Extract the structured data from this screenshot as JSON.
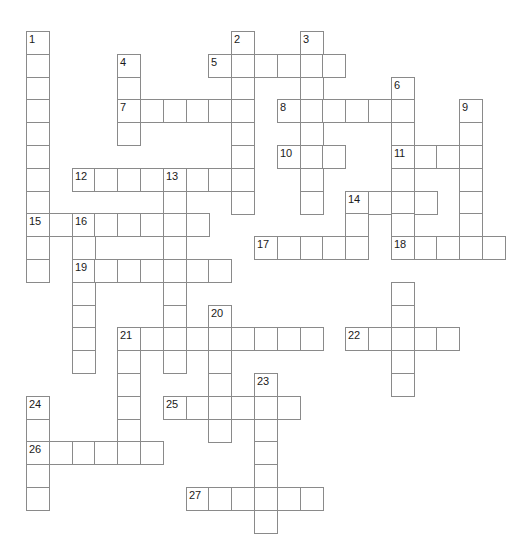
{
  "puzzle": {
    "kind": "crossword-grid",
    "title": "Crossword puzzle grid",
    "cell_size": 22.8,
    "origin_x": 26,
    "origin_y": 31,
    "cols": 21,
    "rows": 22,
    "colors": {
      "background": "#ffffff",
      "cell_fill": "#ffffff",
      "cell_border": "#8a8a8a",
      "number_text": "#1a1a1a"
    },
    "entries": [
      {
        "number": 1,
        "direction": "down",
        "row": 0,
        "col": 0,
        "length": 10
      },
      {
        "number": 2,
        "direction": "down",
        "row": 0,
        "col": 9,
        "length": 8
      },
      {
        "number": 3,
        "direction": "down",
        "row": 0,
        "col": 12,
        "length": 7
      },
      {
        "number": 4,
        "direction": "down",
        "row": 1,
        "col": 4,
        "length": 4
      },
      {
        "number": 5,
        "direction": "across",
        "row": 1,
        "col": 8,
        "length": 6
      },
      {
        "number": 6,
        "direction": "down",
        "row": 2,
        "col": 16,
        "length": 3
      },
      {
        "number": 7,
        "direction": "across",
        "row": 3,
        "col": 4,
        "length": 5
      },
      {
        "number": 8,
        "direction": "across",
        "row": 3,
        "col": 11,
        "length": 5
      },
      {
        "number": 9,
        "direction": "down",
        "row": 3,
        "col": 19,
        "length": 7
      },
      {
        "number": 10,
        "direction": "across",
        "row": 5,
        "col": 11,
        "length": 3
      },
      {
        "number": 11,
        "direction": "across",
        "row": 5,
        "col": 16,
        "length": 3
      },
      {
        "number": 12,
        "direction": "across",
        "row": 6,
        "col": 2,
        "length": 8
      },
      {
        "number": 13,
        "direction": "down",
        "row": 6,
        "col": 6,
        "length": 5
      },
      {
        "number": 14,
        "direction": "across",
        "row": 7,
        "col": 14,
        "length": 4
      },
      {
        "number": 15,
        "direction": "across",
        "row": 8,
        "col": 0,
        "length": 2
      },
      {
        "number": 16,
        "direction": "across",
        "row": 8,
        "col": 2,
        "length": 6
      },
      {
        "number": 17,
        "direction": "across",
        "row": 9,
        "col": 10,
        "length": 5
      },
      {
        "number": 18,
        "direction": "across",
        "row": 9,
        "col": 16,
        "length": 5
      },
      {
        "number": 19,
        "direction": "across",
        "row": 10,
        "col": 2,
        "length": 7
      },
      {
        "number": 20,
        "direction": "down",
        "row": 12,
        "col": 8,
        "length": 6
      },
      {
        "number": 21,
        "direction": "across",
        "row": 13,
        "col": 4,
        "length": 9
      },
      {
        "number": 22,
        "direction": "across",
        "row": 13,
        "col": 14,
        "length": 5
      },
      {
        "number": 23,
        "direction": "down",
        "row": 15,
        "col": 10,
        "length": 7
      },
      {
        "number": 24,
        "direction": "down",
        "row": 16,
        "col": 0,
        "length": 5
      },
      {
        "number": 25,
        "direction": "across",
        "row": 16,
        "col": 6,
        "length": 6
      },
      {
        "number": 26,
        "direction": "across",
        "row": 18,
        "col": 0,
        "length": 6
      },
      {
        "number": 27,
        "direction": "across",
        "row": 20,
        "col": 7,
        "length": 6
      }
    ],
    "extra_cells": [
      {
        "row": 2,
        "col": 9
      },
      {
        "row": 2,
        "col": 12
      },
      {
        "row": 4,
        "col": 9
      },
      {
        "row": 4,
        "col": 12
      },
      {
        "row": 5,
        "col": 9
      },
      {
        "row": 6,
        "col": 0
      },
      {
        "row": 6,
        "col": 12
      },
      {
        "row": 6,
        "col": 16
      },
      {
        "row": 6,
        "col": 19
      },
      {
        "row": 7,
        "col": 0
      },
      {
        "row": 7,
        "col": 12
      },
      {
        "row": 7,
        "col": 19
      },
      {
        "row": 8,
        "col": 14
      },
      {
        "row": 8,
        "col": 16
      },
      {
        "row": 8,
        "col": 19
      },
      {
        "row": 9,
        "col": 0
      },
      {
        "row": 9,
        "col": 2
      },
      {
        "row": 10,
        "col": 0
      },
      {
        "row": 11,
        "col": 2
      },
      {
        "row": 11,
        "col": 6
      },
      {
        "row": 11,
        "col": 16
      },
      {
        "row": 12,
        "col": 2
      },
      {
        "row": 12,
        "col": 6
      },
      {
        "row": 12,
        "col": 16
      },
      {
        "row": 13,
        "col": 2
      },
      {
        "row": 13,
        "col": 6
      },
      {
        "row": 13,
        "col": 16
      },
      {
        "row": 14,
        "col": 2
      },
      {
        "row": 14,
        "col": 4
      },
      {
        "row": 14,
        "col": 6
      },
      {
        "row": 14,
        "col": 16
      },
      {
        "row": 15,
        "col": 4
      },
      {
        "row": 15,
        "col": 8
      },
      {
        "row": 15,
        "col": 16
      },
      {
        "row": 16,
        "col": 4
      },
      {
        "row": 17,
        "col": 4
      },
      {
        "row": 17,
        "col": 8
      },
      {
        "row": 18,
        "col": 4
      },
      {
        "row": 19,
        "col": 0
      },
      {
        "row": 20,
        "col": 0
      }
    ]
  }
}
